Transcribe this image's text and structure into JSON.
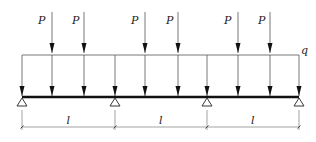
{
  "diagram": {
    "type": "continuous-beam",
    "spans": 3,
    "point_load_label": "P",
    "distributed_load_label": "q",
    "span_length_label": "l",
    "supports_x": [
      22,
      115,
      207,
      299
    ],
    "point_loads_x": [
      52,
      84,
      145,
      178,
      238,
      270
    ],
    "span_labels": [
      "l",
      "l",
      "l"
    ],
    "point_load_labels": [
      "P",
      "P",
      "P",
      "P",
      "P",
      "P"
    ],
    "colors": {
      "line": "#333333",
      "beam": "#111111"
    }
  }
}
